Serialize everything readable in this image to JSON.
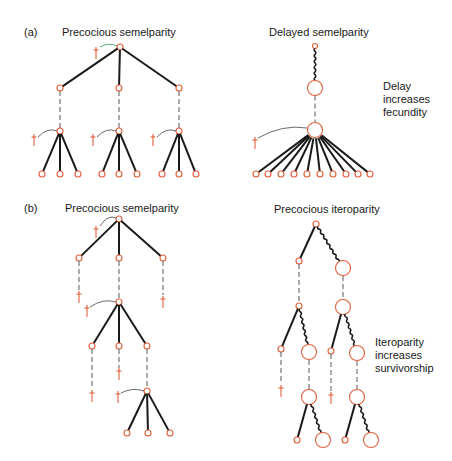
{
  "colors": {
    "node": "#e0603a",
    "branch": "#1a1a1a",
    "death": "#e0603a",
    "dashed": "#555555",
    "text": "#1a1a1a",
    "accent_green": "#2a9a5a"
  },
  "panels": {
    "a": {
      "letter": "(a)",
      "left_title": "Precocious semelparity",
      "right_title": "Delayed semelparity",
      "right_note": [
        "Delay",
        "increases",
        "fecundity"
      ]
    },
    "b": {
      "letter": "(b)",
      "left_title": "Precocious semelparity",
      "right_title": "Precocious iteroparity",
      "right_note": [
        "Iteroparity",
        "increases",
        "survivorship"
      ]
    }
  },
  "legend_semantics": {
    "small_circle": "young individual",
    "large_circle": "older, larger individual",
    "solid_line": "offspring production",
    "wavy_line": "growth / survival of parent",
    "dashed_line": "time to maturity",
    "dagger": "death"
  }
}
